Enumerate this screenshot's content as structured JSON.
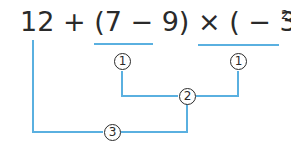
{
  "expression": {
    "term1": "12",
    "op1": "+",
    "group1": "(7 − 9)",
    "op2": "×",
    "group2": "( − 3)",
    "exponent": "2"
  },
  "steps": {
    "step1_left": "1",
    "step1_right": "1",
    "step2": "2",
    "step3": "3"
  },
  "colors": {
    "line": "#5ab0e0",
    "text": "#2a2a2a"
  }
}
